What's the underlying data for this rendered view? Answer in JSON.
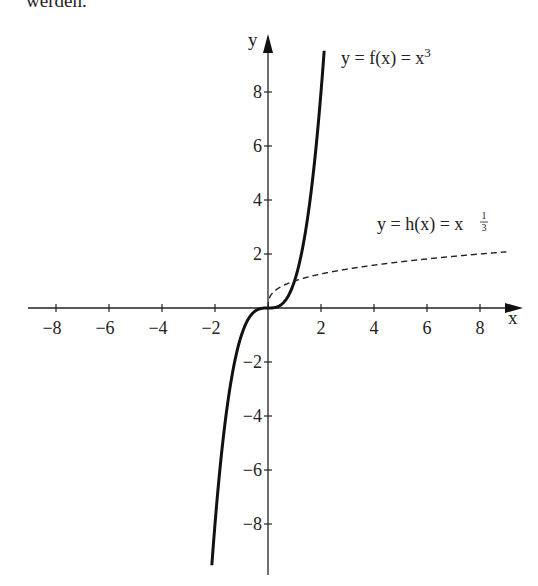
{
  "page": {
    "top_text": "werden."
  },
  "chart_data": {
    "type": "line",
    "title": "",
    "xlabel": "x",
    "ylabel": "y",
    "xlim": [
      -9,
      9
    ],
    "ylim": [
      -10,
      10
    ],
    "grid": false,
    "x_ticks": [
      -8,
      -6,
      -4,
      -2,
      2,
      4,
      6,
      8
    ],
    "y_ticks": [
      -8,
      -6,
      -4,
      -2,
      2,
      4,
      6,
      8
    ],
    "x_tick_labels": [
      "−8",
      "−6",
      "−4",
      "−2",
      "2",
      "4",
      "6",
      "8"
    ],
    "y_tick_labels": [
      "−8",
      "−6",
      "−4",
      "−2",
      "2",
      "4",
      "6",
      "8"
    ],
    "series": [
      {
        "name": "y = f(x) = x³",
        "style": "solid",
        "color": "#111111",
        "x": [
          -2.1,
          -2,
          -1.5,
          -1,
          -0.5,
          0,
          0.5,
          1,
          1.5,
          2,
          2.12
        ],
        "y": [
          -9.26,
          -8,
          -3.375,
          -1,
          -0.125,
          0,
          0.125,
          1,
          3.375,
          8,
          9.53
        ]
      },
      {
        "name": "y = h(x) = x^(1/3)",
        "style": "dashed",
        "color": "#111111",
        "x": [
          0,
          0.125,
          0.5,
          1,
          2,
          4,
          6,
          8,
          9
        ],
        "y": [
          0,
          0.5,
          0.79,
          1,
          1.26,
          1.59,
          1.82,
          2,
          2.08
        ]
      }
    ],
    "annotations": [
      {
        "text": "y = f(x) = x³",
        "near": [
          3,
          9
        ]
      },
      {
        "text": "y = h(x) = x^(1/3)",
        "near": [
          6,
          3.2
        ]
      }
    ]
  },
  "labels": {
    "f_prefix": "y = f(x) = x",
    "f_exp": "3",
    "h_prefix": "y = h(x) = x",
    "h_exp_num": "1",
    "h_exp_den": "3",
    "x_axis": "x",
    "y_axis": "y"
  }
}
